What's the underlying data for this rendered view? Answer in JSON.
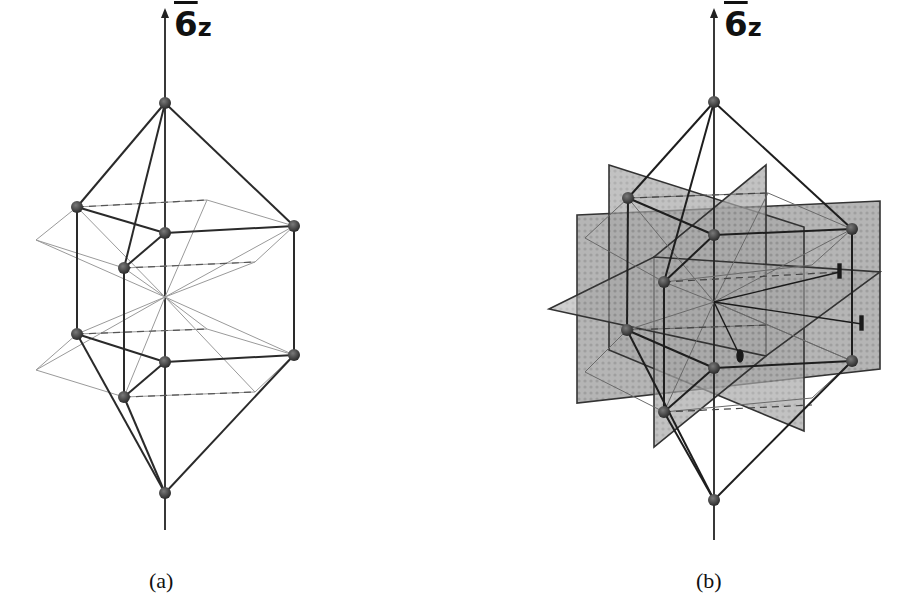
{
  "figure": {
    "panels": [
      {
        "id": "a",
        "caption": "(a)",
        "axis_label_number": "6",
        "axis_label_subscript": "z",
        "axis_label_overbar": true,
        "has_mirror_planes": false
      },
      {
        "id": "b",
        "caption": "(b)",
        "axis_label_number": "6",
        "axis_label_subscript": "z",
        "axis_label_overbar": true,
        "has_mirror_planes": true,
        "mirror_plane_count": 3,
        "twofold_axis_markers": 3
      }
    ],
    "colors": {
      "atom": "#3a3a3a",
      "bond": "#2a2a2a",
      "construction_line": "#9a9a9a",
      "mirror_plane_fill": "#9c9c9c",
      "mirror_plane_edge": "#333333",
      "background": "#ffffff"
    }
  }
}
